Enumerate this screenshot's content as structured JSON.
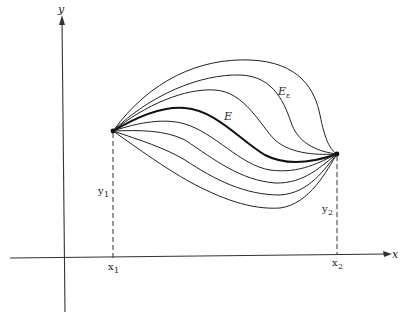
{
  "diagram": {
    "type": "variational-curves-family",
    "axes": {
      "x_label": "x",
      "y_label": "y"
    },
    "endpoints": {
      "left": {
        "x_label": "x",
        "x_sub": "1",
        "y_label": "y",
        "y_sub": "1"
      },
      "right": {
        "x_label": "x",
        "x_sub": "2",
        "y_label": "y",
        "y_sub": "2"
      }
    },
    "curve_labels": {
      "extremal": "E",
      "varied": "E",
      "varied_sub": "ε"
    },
    "curve_count": 8,
    "highlighted_curve": "E"
  }
}
